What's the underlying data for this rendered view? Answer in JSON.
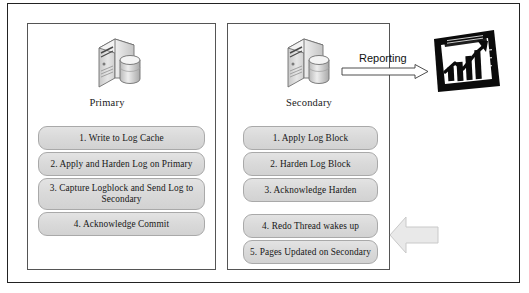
{
  "diagram": {
    "panels": [
      {
        "id": "primary",
        "node_label": "Primary",
        "icon": "server-database-icon",
        "steps": [
          "1. Write to Log Cache",
          "2. Apply and Harden Log on Primary",
          "3. Capture Logblock and Send Log to Secondary",
          "4. Acknowledge Commit"
        ]
      },
      {
        "id": "secondary",
        "node_label": "Secondary",
        "icon": "server-database-icon",
        "steps": [
          "1. Apply Log Block",
          "2. Harden Log Block",
          "3. Acknowledge Harden",
          "4. Redo Thread wakes up",
          "5. Pages Updated on Secondary"
        ]
      }
    ],
    "reporting": {
      "label": "Reporting",
      "arrow": "right-arrow-outline",
      "target_icon": "bar-chart-growth-icon"
    },
    "feedback_arrow": {
      "icon": "left-block-arrow",
      "direction": "left"
    },
    "colors": {
      "frame": "#222222",
      "panel_border": "#555555",
      "step_fill": "#dcdcdc",
      "step_border": "#a9a9a9",
      "text": "#171717",
      "block_arrow_fill": "#e8e8e8",
      "chart_icon": "#000000"
    }
  }
}
